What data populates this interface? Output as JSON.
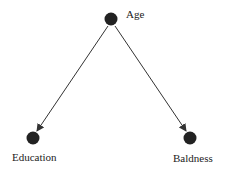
{
  "diagram": {
    "type": "causal-dag",
    "nodes": [
      {
        "id": "age",
        "label": "Age"
      },
      {
        "id": "education",
        "label": "Education"
      },
      {
        "id": "baldness",
        "label": "Baldness"
      }
    ],
    "edges": [
      {
        "from": "age",
        "to": "education"
      },
      {
        "from": "age",
        "to": "baldness"
      }
    ],
    "colors": {
      "node": "#222222",
      "edge": "#333333"
    }
  }
}
